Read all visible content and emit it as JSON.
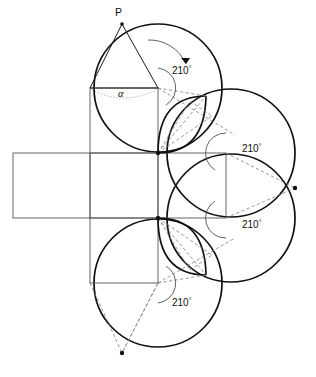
{
  "figure": {
    "apex_label": "P",
    "base_angle_label": "α",
    "angle_value": "210",
    "degree_symbol": "°",
    "angles": [
      {
        "id": "angle-top-left",
        "label": "210",
        "symbol": "°",
        "x": 172,
        "y": 74
      },
      {
        "id": "angle-right-upper",
        "label": "210",
        "symbol": "°",
        "x": 242,
        "y": 152
      },
      {
        "id": "angle-right-lower",
        "label": "210",
        "symbol": "°",
        "x": 242,
        "y": 228
      },
      {
        "id": "angle-bottom-left",
        "label": "210",
        "symbol": "°",
        "x": 172,
        "y": 306
      }
    ],
    "colors": {
      "stroke_solid": "#1a1a1a",
      "stroke_thin": "#555555",
      "stroke_dashed": "#7d7d7d",
      "stroke_dotted": "#9a9a9a",
      "background": "#ffffff"
    },
    "geometry": {
      "net_square_left_x": 90,
      "net_square_right_x": 158,
      "net_square_far_right_x": 226,
      "net_left_rect_x": 13,
      "net_top_y": 88,
      "net_mid_top_y": 153,
      "net_mid_bottom_y": 218,
      "net_bottom_y": 283,
      "apex_x": 122,
      "apex_y": 24,
      "circle_radius": 64,
      "rotation_angle_deg": 210
    }
  }
}
